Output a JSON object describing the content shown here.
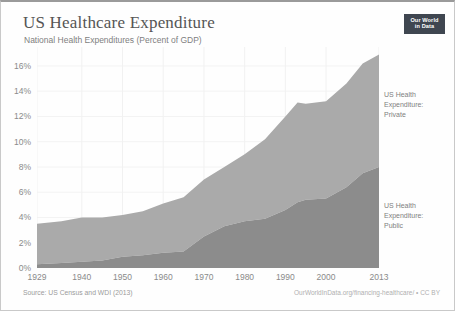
{
  "header": {
    "title": "US Healthcare Expenditure",
    "subtitle": "National Health Expenditures (Percent of GDP)",
    "badge_line1": "Our World",
    "badge_line2": "in Data"
  },
  "footer": {
    "source": "Source: US Census and WDI (2013)",
    "attribution": "OurWorldInData.org/financing-healthcare/ • CC BY"
  },
  "series_labels": {
    "private": "US Health\nExpenditure:\nPrivate",
    "private_l1": "US Health",
    "private_l2": "Expenditure:",
    "private_l3": "Private",
    "public_l1": "US Health",
    "public_l2": "Expenditure:",
    "public_l3": "Public"
  },
  "chart_data": {
    "type": "area",
    "title": "US Healthcare Expenditure",
    "subtitle": "National Health Expenditures (Percent of GDP)",
    "xlabel": "",
    "ylabel": "Percent of GDP",
    "stacked": true,
    "grid": true,
    "legend_position": "inline-right",
    "xlim": [
      1929,
      2013
    ],
    "ylim": [
      0,
      17.5
    ],
    "ytick_labels": [
      "0%",
      "2%",
      "4%",
      "6%",
      "8%",
      "10%",
      "12%",
      "14%",
      "16%"
    ],
    "ytick_values": [
      0,
      2,
      4,
      6,
      8,
      10,
      12,
      14,
      16
    ],
    "xtick_labels": [
      "1929",
      "1940",
      "1950",
      "1960",
      "1970",
      "1980",
      "1990",
      "2000",
      "2013"
    ],
    "xtick_values": [
      1929,
      1940,
      1950,
      1960,
      1970,
      1980,
      1990,
      2000,
      2013
    ],
    "x": [
      1929,
      1935,
      1940,
      1945,
      1950,
      1955,
      1960,
      1965,
      1970,
      1975,
      1980,
      1985,
      1990,
      1993,
      1995,
      2000,
      2005,
      2009,
      2013
    ],
    "series": [
      {
        "name": "US Health Expenditure: Public",
        "color": "#8c8c8c",
        "values": [
          0.3,
          0.4,
          0.5,
          0.6,
          0.9,
          1.0,
          1.2,
          1.3,
          2.5,
          3.3,
          3.7,
          3.9,
          4.6,
          5.2,
          5.4,
          5.5,
          6.4,
          7.5,
          8.0
        ]
      },
      {
        "name": "US Health Expenditure: Private",
        "color": "#aaaaaa",
        "values": [
          3.2,
          3.3,
          3.5,
          3.4,
          3.3,
          3.5,
          3.9,
          4.3,
          4.5,
          4.7,
          5.3,
          6.3,
          7.4,
          7.9,
          7.6,
          7.7,
          8.2,
          8.7,
          8.9
        ]
      }
    ],
    "totals": [
      3.5,
      3.7,
      4.0,
      4.0,
      4.2,
      4.5,
      5.1,
      5.6,
      7.0,
      8.0,
      9.0,
      10.2,
      12.0,
      13.1,
      13.0,
      13.2,
      14.6,
      16.2,
      16.9
    ]
  }
}
